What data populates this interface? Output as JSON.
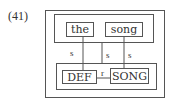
{
  "example_number": "(41)",
  "upper_nodes": [
    "the",
    "song"
  ],
  "lower_nodes": [
    "DEF",
    "SONG"
  ],
  "links": {
    "s_left": "s",
    "s_middle": "s",
    "s_right": "s",
    "r": "r"
  }
}
